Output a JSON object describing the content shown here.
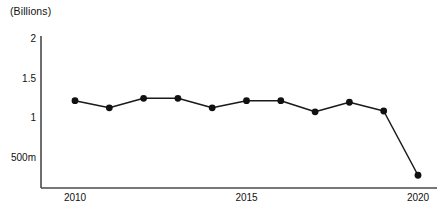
{
  "chart_data": {
    "type": "line",
    "title": "(Billions)",
    "xlabel": "",
    "ylabel": "",
    "x": [
      2010,
      2011,
      2012,
      2013,
      2014,
      2015,
      2016,
      2017,
      2018,
      2019,
      2020
    ],
    "values": [
      1.21,
      1.12,
      1.24,
      1.24,
      1.12,
      1.21,
      1.21,
      1.07,
      1.19,
      1.08,
      0.27
    ],
    "series": [
      {
        "name": "",
        "values": [
          1.21,
          1.12,
          1.24,
          1.24,
          1.12,
          1.21,
          1.21,
          1.07,
          1.19,
          1.08,
          0.27
        ]
      }
    ],
    "ylim": [
      0,
      2
    ],
    "xlim": [
      2009.5,
      2020.3
    ],
    "yticks": [
      2,
      1.5,
      1,
      0.5
    ],
    "ytick_labels": [
      "2",
      "1.5",
      "1",
      "500m"
    ],
    "xticks": [
      2010,
      2015,
      2020
    ],
    "xtick_labels": [
      "2010",
      "2015",
      "2020"
    ],
    "grid": false,
    "legend": false,
    "marker": "circle",
    "line_color": "#1a1a1a",
    "marker_color": "#111111",
    "axis_color": "#444444",
    "background": "#ffffff"
  },
  "chart": {
    "title": "(Billions)",
    "y_axis": {
      "ticks": [
        {
          "label": "2",
          "value": 2
        },
        {
          "label": "1.5",
          "value": 1.5
        },
        {
          "label": "1",
          "value": 1
        },
        {
          "label": "500m",
          "value": 0.5
        }
      ]
    },
    "x_axis": {
      "ticks": [
        {
          "label": "2010",
          "value": 2010
        },
        {
          "label": "2015",
          "value": 2015
        },
        {
          "label": "2020",
          "value": 2020
        }
      ]
    }
  }
}
